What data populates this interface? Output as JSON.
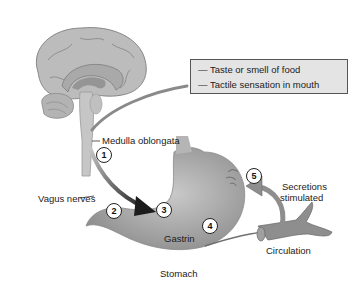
{
  "diagram": {
    "type": "physiology-flow",
    "stimuli_box": {
      "items": [
        "— Taste or smell of food",
        "— Tactile sensation in mouth"
      ]
    },
    "labels": {
      "medulla": "Medulla oblongata",
      "vagus": "Vagus nerves",
      "gastrin": "Gastrin",
      "stomach": "Stomach",
      "secretions_line1": "Secretions",
      "secretions_line2": "stimulated",
      "circulation": "Circulation"
    },
    "steps": [
      "1",
      "2",
      "3",
      "4",
      "5"
    ],
    "colors": {
      "brain": "#b9b9b9",
      "stomach": "#a9a9a9",
      "arrow_dark": "#2a2a2a",
      "vessel": "#8e8e8e",
      "box_fill": "#e4e4e4"
    }
  }
}
